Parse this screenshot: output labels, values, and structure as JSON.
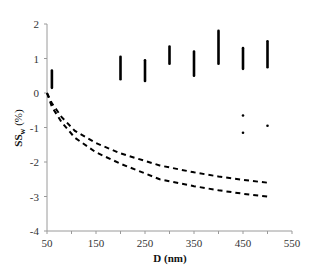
{
  "chart_data": {
    "type": "scatter",
    "title": "",
    "xlabel": "D (nm)",
    "ylabel_main": "SS",
    "ylabel_sub": "w",
    "ylabel_unit": " (%)",
    "xlim": [
      50,
      550
    ],
    "ylim": [
      -4,
      2
    ],
    "xticks": [
      50,
      150,
      250,
      350,
      450,
      550
    ],
    "xticks_minor": [
      100,
      200,
      300,
      400,
      500
    ],
    "yticks": [
      2,
      1,
      0,
      -1,
      -2,
      -3,
      -4
    ],
    "grid": false,
    "legend": null,
    "series": [
      {
        "name": "observed-ranges",
        "kind": "vertical-clusters",
        "color": "#000000",
        "clusters": [
          {
            "x": 60,
            "ymin": 0.15,
            "ymax": 0.65
          },
          {
            "x": 200,
            "ymin": 0.4,
            "ymax": 1.05
          },
          {
            "x": 250,
            "ymin": 0.35,
            "ymax": 0.95
          },
          {
            "x": 300,
            "ymin": 0.85,
            "ymax": 1.35
          },
          {
            "x": 350,
            "ymin": 0.5,
            "ymax": 1.2
          },
          {
            "x": 400,
            "ymin": 0.85,
            "ymax": 1.8
          },
          {
            "x": 450,
            "ymin": 0.7,
            "ymax": 1.3
          },
          {
            "x": 500,
            "ymin": 0.75,
            "ymax": 1.5
          }
        ]
      },
      {
        "name": "outliers",
        "kind": "points",
        "color": "#000000",
        "points": [
          {
            "x": 450,
            "y": -0.65
          },
          {
            "x": 450,
            "y": -1.15
          },
          {
            "x": 500,
            "y": -0.95
          }
        ]
      },
      {
        "name": "upper-dashed-curve",
        "kind": "dashed-line",
        "color": "#000000",
        "x": [
          50,
          60,
          80,
          107,
          150,
          200,
          280,
          350,
          400,
          450,
          500
        ],
        "values": [
          0,
          -0.3,
          -0.7,
          -1.1,
          -1.45,
          -1.75,
          -2.1,
          -2.3,
          -2.42,
          -2.52,
          -2.6
        ]
      },
      {
        "name": "lower-dashed-curve",
        "kind": "dashed-line",
        "color": "#000000",
        "x": [
          50,
          60,
          80,
          107,
          150,
          200,
          280,
          350,
          400,
          450,
          500
        ],
        "values": [
          0,
          -0.4,
          -0.85,
          -1.3,
          -1.72,
          -2.05,
          -2.5,
          -2.7,
          -2.82,
          -2.92,
          -3.0
        ]
      }
    ]
  }
}
